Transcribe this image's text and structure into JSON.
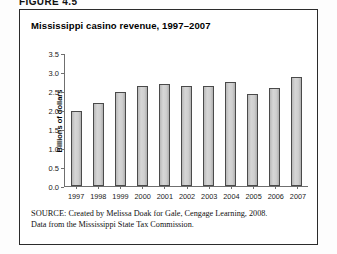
{
  "figure_label": "FIGURE 4.5",
  "chart_title": "Mississippi casino revenue, 1997–2007",
  "source": {
    "prefix": "SOURCE:",
    "line1": " Created by Melissa Doak for Gale, Cengage Learning, 2008.",
    "line2": "Data from the Mississippi State Tax Commission."
  },
  "chart_data": {
    "type": "bar",
    "title": "Mississippi casino revenue, 1997–2007",
    "xlabel": "",
    "ylabel": "Billions of dollars",
    "categories": [
      "1997",
      "1998",
      "1999",
      "2000",
      "2001",
      "2002",
      "2003",
      "2004",
      "2005",
      "2006",
      "2007"
    ],
    "values": [
      2.0,
      2.2,
      2.5,
      2.65,
      2.7,
      2.65,
      2.65,
      2.75,
      2.45,
      2.6,
      2.9
    ],
    "ylim": [
      0.0,
      3.5
    ],
    "yticks": [
      "0.0",
      "0.5",
      "1.0",
      "1.5",
      "2.0",
      "2.5",
      "3.0",
      "3.5"
    ],
    "ytick_values": [
      0.0,
      0.5,
      1.0,
      1.5,
      2.0,
      2.5,
      3.0,
      3.5
    ],
    "grid": false,
    "legend": false,
    "bar_color": "#cfcfcf",
    "bar_edge_color": "#4a4a4a",
    "axis_color": "#6f6f6f"
  }
}
